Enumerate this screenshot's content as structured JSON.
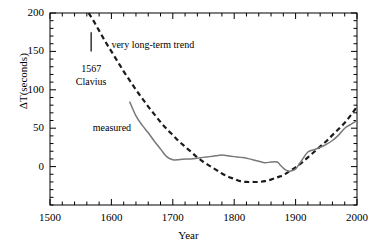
{
  "chart_data": {
    "type": "line",
    "title": "",
    "subtitle": "",
    "xlabel": "Year",
    "ylabel": "ΔT(seconds)",
    "xlim": [
      1500,
      2000
    ],
    "ylim": [
      -50,
      200
    ],
    "xticks": [
      1500,
      1600,
      1700,
      1800,
      1900,
      2000
    ],
    "xtick_labels": [
      "1500",
      "1600",
      "1700",
      "1800",
      "1900",
      "2000"
    ],
    "xminor_step": 20,
    "yticks": [
      0,
      50,
      100,
      150,
      200
    ],
    "ytick_labels": [
      "0",
      "50",
      "100",
      "150",
      "200"
    ],
    "yminor_step": 10,
    "grid": false,
    "legend_position": "inline-annotations",
    "series": [
      {
        "name": "very long-term trend",
        "style": "dashed",
        "color": "#1a1a1a",
        "x": [
          1563,
          1570,
          1580,
          1590,
          1600,
          1610,
          1620,
          1630,
          1640,
          1650,
          1660,
          1670,
          1680,
          1690,
          1700,
          1710,
          1720,
          1730,
          1740,
          1750,
          1760,
          1770,
          1780,
          1790,
          1800,
          1810,
          1820,
          1830,
          1840,
          1850,
          1860,
          1870,
          1880,
          1890,
          1900,
          1910,
          1920,
          1930,
          1940,
          1950,
          1960,
          1970,
          1980,
          1990,
          2000
        ],
        "y": [
          200,
          191,
          177,
          163,
          150,
          137,
          124,
          112,
          100,
          89,
          78,
          68,
          58,
          49,
          41,
          33,
          26,
          19,
          12,
          6,
          1,
          -4,
          -9,
          -13,
          -16,
          -19,
          -20,
          -20,
          -20,
          -19,
          -17,
          -14,
          -11,
          -6,
          -1,
          5,
          12,
          19,
          26,
          33,
          41,
          49,
          57,
          67,
          78
        ]
      },
      {
        "name": "measured",
        "style": "solid",
        "color": "#787878",
        "x": [
          1630,
          1640,
          1650,
          1660,
          1670,
          1680,
          1690,
          1700,
          1710,
          1720,
          1730,
          1740,
          1750,
          1760,
          1770,
          1780,
          1790,
          1800,
          1810,
          1820,
          1830,
          1840,
          1850,
          1860,
          1870,
          1875,
          1880,
          1885,
          1890,
          1895,
          1900,
          1910,
          1920,
          1930,
          1940,
          1950,
          1960,
          1970,
          1980,
          1990,
          2000
        ],
        "y": [
          84,
          66,
          54,
          44,
          33,
          23,
          13,
          9,
          9,
          10,
          10,
          11,
          12,
          13,
          14,
          15,
          14,
          13,
          12,
          11,
          9,
          7,
          5,
          6,
          6,
          2,
          -2,
          -5,
          -6,
          -5,
          -3,
          8,
          19,
          22,
          25,
          29,
          34,
          41,
          50,
          55,
          60
        ]
      }
    ],
    "annotations": [
      {
        "id": "trend-label",
        "text": "very long-term trend",
        "x": 1600,
        "y": 160
      },
      {
        "id": "clavius-label-year",
        "text": "1567",
        "x": 1567,
        "y": 128
      },
      {
        "id": "clavius-label-name",
        "text": "Clavius",
        "x": 1567,
        "y": 112
      },
      {
        "id": "measured-label",
        "text": "measured",
        "x": 1625,
        "y": 52
      }
    ],
    "markers": [
      {
        "id": "clavius-datum",
        "label": "1567 Clavius",
        "x": 1567,
        "y_low": 150,
        "y_high": 175,
        "style": "vertical-bar"
      }
    ]
  },
  "colors": {
    "background": "#ffffff",
    "axis": "#000000",
    "measured_line": "#787878",
    "trend_line": "#1a1a1a",
    "text": "#000000"
  }
}
